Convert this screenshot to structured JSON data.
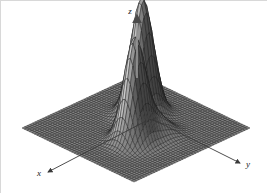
{
  "figure": {
    "title": "",
    "background_color": "#ffffff",
    "width": 267,
    "height": 193,
    "border_color": "#d8d8d8"
  },
  "axes": {
    "x": {
      "label": "x",
      "arrow": "arrow-down-left",
      "tip_x": 48,
      "tip_y": 172,
      "tail_x": 146,
      "tail_y": 121
    },
    "y": {
      "label": "y",
      "arrow": "arrow-down-right",
      "tip_x": 240,
      "tip_y": 163,
      "tail_x": 152,
      "tail_y": 119
    },
    "z": {
      "label": "z",
      "arrow": "arrow-up",
      "tip_x": 137,
      "tip_y": 10,
      "tail_x": 137,
      "tail_y": 72
    }
  },
  "surface": {
    "style": "wireframe-mesh",
    "mesh_color": "#1e1e1e",
    "fill_color": "#8a8a8a",
    "grid_n": 46,
    "projection": "isometric",
    "base_corners": {
      "left": [
        22,
        128
      ],
      "top": [
        138,
        74
      ],
      "right": [
        250,
        128
      ],
      "bottom": [
        140,
        174
      ]
    }
  },
  "chart_data": {
    "type": "surface",
    "title": "",
    "xlabel": "x",
    "ylabel": "y",
    "zlabel": "z",
    "grid": true,
    "legend": null,
    "xlim": [
      -3,
      3
    ],
    "ylim": [
      -3,
      3
    ],
    "zlim": [
      0,
      1
    ],
    "function": "z = 1.00*exp(-((x+0.85)^2+(y+0.55)^2)/0.38) + 0.86*exp(-((x-0.75)^2+(y-0.70)^2)/0.34) + 0.17*exp(-((x+0.15)^2+(y-0.95)^2)/0.45)",
    "peaks": [
      {
        "name": "peak-1",
        "x": -0.85,
        "y": -0.55,
        "z": 1.0
      },
      {
        "name": "peak-2",
        "x": 0.75,
        "y": 0.7,
        "z": 0.86
      },
      {
        "name": "bump-1",
        "x": -0.15,
        "y": 0.95,
        "z": 0.17
      }
    ],
    "xticks": [],
    "yticks": [],
    "zticks": []
  }
}
